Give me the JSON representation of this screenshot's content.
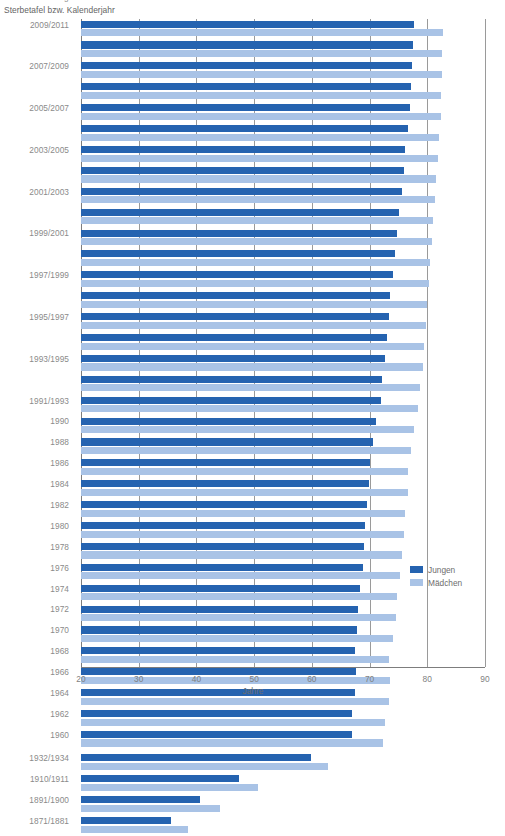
{
  "header": {
    "title_clipped": "Lebenserwartung bei Geburt in Deutschland",
    "subtitle": "Sterbetafel bzw. Kalenderjahr"
  },
  "axis": {
    "x_title": "Jahre",
    "x_ticks": [
      "20",
      "30",
      "40",
      "50",
      "60",
      "70",
      "80",
      "90"
    ],
    "x_min": 20,
    "x_max": 90
  },
  "legend": {
    "items": [
      {
        "label": "Jungen",
        "color": "#2563b0"
      },
      {
        "label": "Mädchen",
        "color": "#a9c3e6"
      }
    ]
  },
  "colors": {
    "boys": "#2563b0",
    "girls": "#a9c3e6",
    "gridline": "#9a9a9a",
    "axis": "#7d7d7d",
    "text": "#8a8a8a"
  },
  "chart_data": {
    "type": "bar",
    "orientation": "horizontal",
    "title": "Lebenserwartung bei Geburt in Deutschland",
    "subtitle": "Sterbetafel bzw. Kalenderjahr",
    "xlabel": "Jahre",
    "ylabel": "Sterbetafel bzw. Kalenderjahr",
    "xlim": [
      20,
      90
    ],
    "xticks": [
      20,
      30,
      40,
      50,
      60,
      70,
      80,
      90
    ],
    "grid": "vertical",
    "legend_position": "right-middle",
    "categories": [
      "2009/2011",
      "2008/2010",
      "2007/2009",
      "2006/2008",
      "2005/2007",
      "2004/2006",
      "2003/2005",
      "2002/2004",
      "2001/2003",
      "2000/2002",
      "1999/2001",
      "1998/2000",
      "1997/1999",
      "1996/1998",
      "1995/1997",
      "1994/1996",
      "1993/1995",
      "1992/1994",
      "1991/1993",
      "1990",
      "1988",
      "1986",
      "1984",
      "1982",
      "1980",
      "1978",
      "1976",
      "1974",
      "1972",
      "1970",
      "1968",
      "1966",
      "1964",
      "1962",
      "1960",
      "1932/1934",
      "1910/1911",
      "1891/1900",
      "1871/1881"
    ],
    "labeled_categories": [
      "2009/2011",
      "2007/2009",
      "2005/2007",
      "2003/2005",
      "2001/2003",
      "1999/2001",
      "1997/1999",
      "1995/1997",
      "1993/1995",
      "1991/1993",
      "1990",
      "1988",
      "1986",
      "1984",
      "1982",
      "1980",
      "1978",
      "1976",
      "1974",
      "1972",
      "1970",
      "1968",
      "1966",
      "1964",
      "1962",
      "1960",
      "1932/1934",
      "1910/1911",
      "1891/1900",
      "1871/1881"
    ],
    "series": [
      {
        "name": "Jungen",
        "color": "#2563b0",
        "values": [
          77.7,
          77.5,
          77.3,
          77.2,
          77.0,
          76.6,
          76.2,
          75.9,
          75.6,
          75.1,
          74.8,
          74.4,
          74.0,
          73.6,
          73.3,
          73.0,
          72.6,
          72.2,
          71.9,
          71.2,
          70.6,
          70.1,
          69.9,
          69.5,
          69.2,
          69.0,
          68.8,
          68.3,
          68.0,
          67.9,
          67.4,
          67.6,
          67.5,
          67.0,
          66.9,
          59.9,
          47.4,
          40.6,
          35.6
        ]
      },
      {
        "name": "Mädchen",
        "color": "#a9c3e6",
        "values": [
          82.7,
          82.6,
          82.5,
          82.4,
          82.3,
          82.0,
          81.8,
          81.5,
          81.3,
          81.0,
          80.8,
          80.5,
          80.3,
          80.0,
          79.7,
          79.5,
          79.2,
          78.8,
          78.4,
          77.7,
          77.2,
          76.7,
          76.6,
          76.2,
          75.9,
          75.6,
          75.3,
          74.8,
          74.5,
          74.0,
          73.4,
          73.5,
          73.3,
          72.6,
          72.4,
          62.8,
          50.7,
          44.0,
          38.5
        ]
      }
    ]
  }
}
